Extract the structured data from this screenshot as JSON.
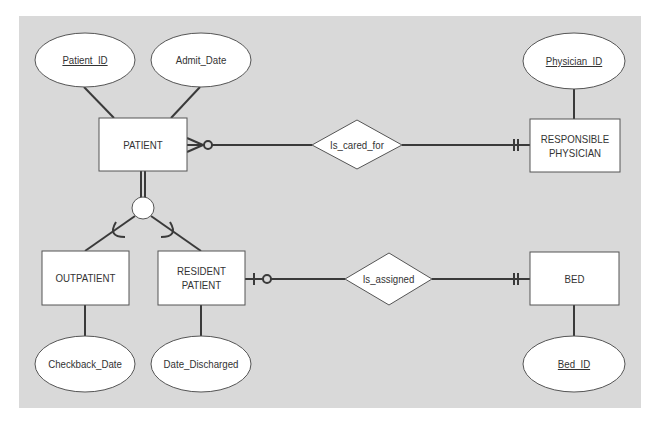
{
  "colors": {
    "panel": "#d9d9d9",
    "line": "#3a3a3a",
    "shape_fill": "#ffffff",
    "text": "#333333"
  },
  "entities": {
    "patient": {
      "label": "PATIENT"
    },
    "responsible_physician": {
      "label_line1": "RESPONSIBLE",
      "label_line2": "PHYSICIAN"
    },
    "outpatient": {
      "label": "OUTPATIENT"
    },
    "resident_patient": {
      "label_line1": "RESIDENT",
      "label_line2": "PATIENT"
    },
    "bed": {
      "label": "BED"
    }
  },
  "attributes": {
    "patient_id": {
      "label": "Patient_ID",
      "key": true
    },
    "admit_date": {
      "label": "Admit_Date",
      "key": false
    },
    "physician_id": {
      "label": "Physician_ID",
      "key": true
    },
    "checkback_date": {
      "label": "Checkback_Date",
      "key": false
    },
    "date_discharged": {
      "label": "Date_Discharged",
      "key": false
    },
    "bed_id": {
      "label": "Bed_ID",
      "key": true
    }
  },
  "relationships": {
    "is_cared_for": {
      "label": "Is_cared_for",
      "left_cardinality": "zero-or-many",
      "right_cardinality": "one-and-only-one"
    },
    "is_assigned": {
      "label": "Is_assigned",
      "left_cardinality": "zero-or-one",
      "right_cardinality": "one-and-only-one"
    }
  },
  "subtype_connector": {
    "type": "circle",
    "supertype": "PATIENT",
    "subtypes": [
      "OUTPATIENT",
      "RESIDENT PATIENT"
    ],
    "completeness": "total"
  }
}
